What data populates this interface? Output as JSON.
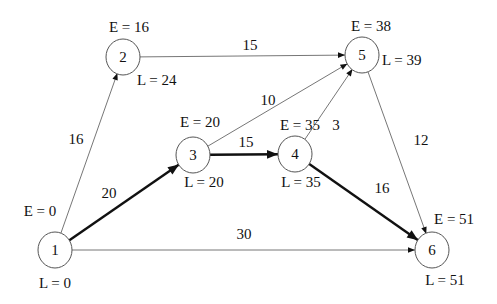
{
  "diagram": {
    "type": "critical-path-network",
    "nodes": [
      {
        "id": "1",
        "label": "1",
        "x": 55,
        "y": 250,
        "r": 17,
        "E": "E = 0",
        "L": "L = 0",
        "E_pos": {
          "x": 40,
          "y": 211,
          "anchor": "middle"
        },
        "L_pos": {
          "x": 55,
          "y": 283,
          "anchor": "middle"
        }
      },
      {
        "id": "2",
        "label": "2",
        "x": 123,
        "y": 57,
        "r": 17,
        "E": "E = 16",
        "L": "L = 24",
        "E_pos": {
          "x": 129,
          "y": 27,
          "anchor": "middle"
        },
        "L_pos": {
          "x": 137,
          "y": 80,
          "anchor": "start"
        }
      },
      {
        "id": "3",
        "label": "3",
        "x": 193,
        "y": 155,
        "r": 17,
        "E": "E = 20",
        "L": "L = 20",
        "E_pos": {
          "x": 200,
          "y": 122,
          "anchor": "middle"
        },
        "L_pos": {
          "x": 204,
          "y": 182,
          "anchor": "middle"
        }
      },
      {
        "id": "4",
        "label": "4",
        "x": 295,
        "y": 154,
        "r": 17,
        "E": "E = 35",
        "L": "L = 35",
        "E_pos": {
          "x": 300,
          "y": 125,
          "anchor": "middle"
        },
        "L_pos": {
          "x": 301,
          "y": 182,
          "anchor": "middle"
        }
      },
      {
        "id": "5",
        "label": "5",
        "x": 362,
        "y": 55,
        "r": 17,
        "E": "E = 38",
        "L": "L = 39",
        "E_pos": {
          "x": 371,
          "y": 26,
          "anchor": "middle"
        },
        "L_pos": {
          "x": 382,
          "y": 60,
          "anchor": "start"
        }
      },
      {
        "id": "6",
        "label": "6",
        "x": 432,
        "y": 250,
        "r": 17,
        "E": "E = 51",
        "L": "L = 51",
        "E_pos": {
          "x": 434,
          "y": 219,
          "anchor": "start"
        },
        "L_pos": {
          "x": 445,
          "y": 280,
          "anchor": "middle"
        }
      }
    ],
    "edges": [
      {
        "from": "1",
        "to": "2",
        "weight": "16",
        "critical": false,
        "label_pos": {
          "x": 76,
          "y": 139
        }
      },
      {
        "from": "2",
        "to": "5",
        "weight": "15",
        "critical": false,
        "label_pos": {
          "x": 250,
          "y": 45
        }
      },
      {
        "from": "1",
        "to": "3",
        "weight": "20",
        "critical": true,
        "label_pos": {
          "x": 109,
          "y": 193
        }
      },
      {
        "from": "3",
        "to": "5",
        "weight": "10",
        "critical": false,
        "label_pos": {
          "x": 268,
          "y": 100
        }
      },
      {
        "from": "3",
        "to": "4",
        "weight": "15",
        "critical": true,
        "label_pos": {
          "x": 246,
          "y": 142
        }
      },
      {
        "from": "4",
        "to": "5",
        "weight": "3",
        "critical": false,
        "label_pos": {
          "x": 336,
          "y": 125
        }
      },
      {
        "from": "4",
        "to": "6",
        "weight": "16",
        "critical": true,
        "label_pos": {
          "x": 382,
          "y": 188
        }
      },
      {
        "from": "5",
        "to": "6",
        "weight": "12",
        "critical": false,
        "label_pos": {
          "x": 421,
          "y": 140
        }
      },
      {
        "from": "1",
        "to": "6",
        "weight": "30",
        "critical": false,
        "label_pos": {
          "x": 244,
          "y": 234
        }
      }
    ],
    "colors": {
      "background": "#ffffff",
      "critical_edge": "#111111",
      "normal_edge": "#666666",
      "node_stroke": "#555555",
      "text": "#111111"
    }
  }
}
